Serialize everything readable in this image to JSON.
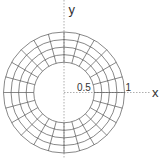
{
  "diagram": {
    "type": "polar-grid-annulus",
    "axes": {
      "x_label": "x",
      "y_label": "y",
      "axis_color": "#9a9a9a"
    },
    "tick_labels": {
      "inner_radius": "0.5",
      "outer_radius": "1"
    },
    "grid": {
      "inner_radius": 0.5,
      "outer_radius": 1.0,
      "ring_count": 4,
      "spoke_count": 24,
      "line_color": "#555555"
    },
    "geometry": {
      "cx": 64,
      "cy": 92.5,
      "scale": 60.5
    }
  }
}
